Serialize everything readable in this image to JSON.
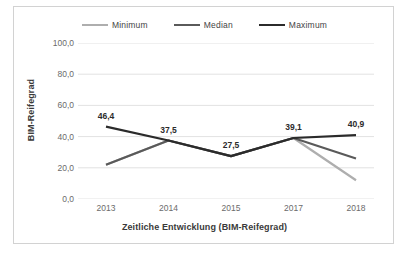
{
  "chart_data": {
    "type": "line",
    "title": "",
    "xlabel": "Zeitliche Entwicklung (BIM-Reifegrad)",
    "ylabel": "BIM-Reifegrad",
    "categories": [
      "2013",
      "2014",
      "2015",
      "2017",
      "2018"
    ],
    "ylim": [
      0,
      100
    ],
    "ytick_labels": [
      "100,0",
      "80,0",
      "60,0",
      "40,0",
      "20,0",
      "0,0"
    ],
    "ytick_values": [
      100,
      80,
      60,
      40,
      20,
      0
    ],
    "grid": true,
    "legend_position": "top-center",
    "series": [
      {
        "name": "Minimum",
        "color": "#aeaeae",
        "values": [
          22.0,
          37.5,
          27.5,
          39.1,
          12.0
        ]
      },
      {
        "name": "Median",
        "color": "#5a5a5a",
        "values": [
          22.0,
          37.5,
          27.5,
          39.1,
          26.0
        ]
      },
      {
        "name": "Maximum",
        "color": "#2b2b2b",
        "values": [
          46.4,
          37.5,
          27.5,
          39.1,
          40.9
        ]
      }
    ],
    "data_labels": [
      {
        "text": "46,4",
        "category": "2013",
        "value": 46.4
      },
      {
        "text": "37,5",
        "category": "2014",
        "value": 37.5
      },
      {
        "text": "27,5",
        "category": "2015",
        "value": 27.5
      },
      {
        "text": "39,1",
        "category": "2017",
        "value": 39.1
      },
      {
        "text": "40,9",
        "category": "2018",
        "value": 40.9
      }
    ]
  },
  "colors": {
    "minimum": "#aeaeae",
    "median": "#5a5a5a",
    "maximum": "#2b2b2b",
    "gridline": "#e2e2e2",
    "border": "#d2d2d2",
    "tick_text": "#6b6b6b",
    "title_text": "#3a3a3a"
  }
}
